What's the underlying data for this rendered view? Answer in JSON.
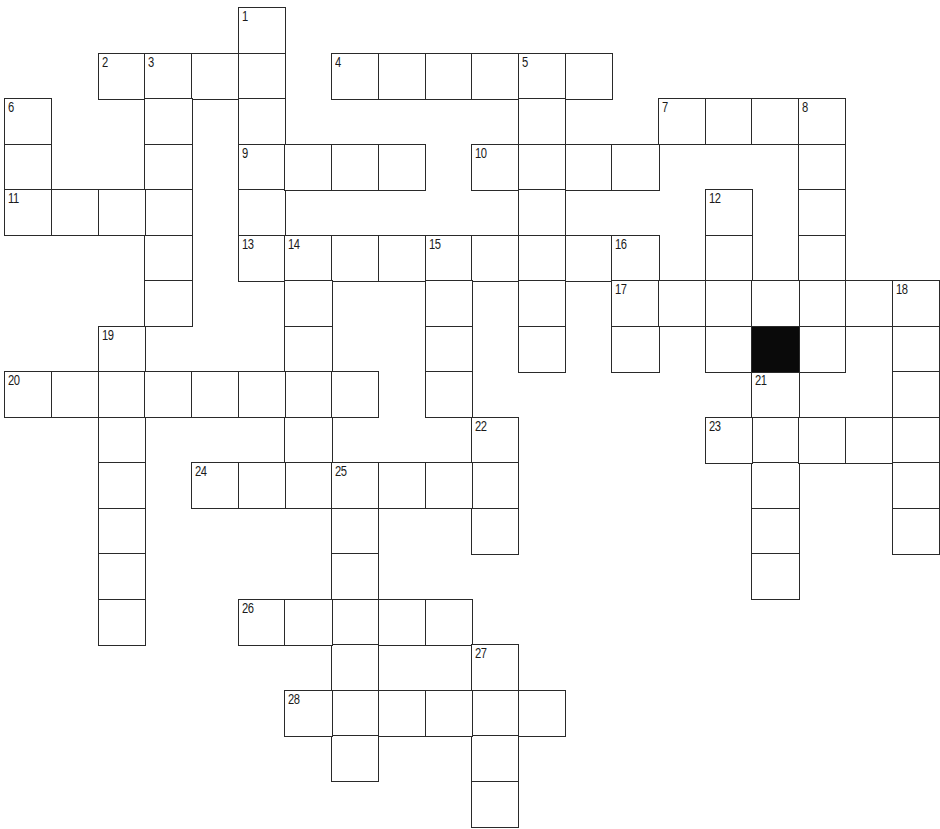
{
  "puzzle": {
    "grid": {
      "origin_x": 5,
      "origin_y": 8,
      "cell_w": 46.7,
      "cell_h": 45.5,
      "cols": 20,
      "rows": 18,
      "line_color": "#2a2a2a",
      "block_color": "#0a0a0a"
    },
    "blocks": [
      [
        7,
        16
      ]
    ],
    "entries": [
      {
        "num": 1,
        "dir": "down",
        "row": 0,
        "col": 5,
        "len": 6
      },
      {
        "num": 2,
        "dir": "across",
        "row": 1,
        "col": 2,
        "len": 4
      },
      {
        "num": 3,
        "dir": "down",
        "row": 1,
        "col": 3,
        "len": 6
      },
      {
        "num": 4,
        "dir": "across",
        "row": 1,
        "col": 7,
        "len": 6
      },
      {
        "num": 5,
        "dir": "down",
        "row": 1,
        "col": 11,
        "len": 7
      },
      {
        "num": 6,
        "dir": "down",
        "row": 2,
        "col": 0,
        "len": 3
      },
      {
        "num": 7,
        "dir": "across",
        "row": 2,
        "col": 14,
        "len": 4
      },
      {
        "num": 8,
        "dir": "down",
        "row": 2,
        "col": 17,
        "len": 6
      },
      {
        "num": 9,
        "dir": "across",
        "row": 3,
        "col": 5,
        "len": 4
      },
      {
        "num": 10,
        "dir": "across",
        "row": 3,
        "col": 10,
        "len": 4
      },
      {
        "num": 11,
        "dir": "across",
        "row": 4,
        "col": 0,
        "len": 4
      },
      {
        "num": 12,
        "dir": "down",
        "row": 4,
        "col": 15,
        "len": 4
      },
      {
        "num": 13,
        "dir": "across",
        "row": 5,
        "col": 5,
        "len": 9
      },
      {
        "num": 14,
        "dir": "down",
        "row": 5,
        "col": 6,
        "len": 6
      },
      {
        "num": 15,
        "dir": "down",
        "row": 5,
        "col": 9,
        "len": 4
      },
      {
        "num": 16,
        "dir": "down",
        "row": 5,
        "col": 13,
        "len": 3
      },
      {
        "num": 17,
        "dir": "across",
        "row": 6,
        "col": 13,
        "len": 7
      },
      {
        "num": 18,
        "dir": "down",
        "row": 6,
        "col": 19,
        "len": 6
      },
      {
        "num": 19,
        "dir": "down",
        "row": 7,
        "col": 2,
        "len": 7
      },
      {
        "num": 20,
        "dir": "across",
        "row": 8,
        "col": 0,
        "len": 8
      },
      {
        "num": 21,
        "dir": "down",
        "row": 8,
        "col": 16,
        "len": 5
      },
      {
        "num": 22,
        "dir": "down",
        "row": 9,
        "col": 10,
        "len": 3
      },
      {
        "num": 23,
        "dir": "across",
        "row": 9,
        "col": 15,
        "len": 5
      },
      {
        "num": 24,
        "dir": "across",
        "row": 10,
        "col": 4,
        "len": 7
      },
      {
        "num": 25,
        "dir": "down",
        "row": 10,
        "col": 7,
        "len": 7
      },
      {
        "num": 26,
        "dir": "across",
        "row": 13,
        "col": 5,
        "len": 5
      },
      {
        "num": 27,
        "dir": "down",
        "row": 14,
        "col": 10,
        "len": 4
      },
      {
        "num": 28,
        "dir": "across",
        "row": 15,
        "col": 6,
        "len": 6
      }
    ]
  }
}
